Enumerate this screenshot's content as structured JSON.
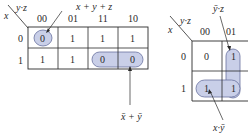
{
  "colors": {
    "grid": "#2a2a2a",
    "group_fill": "#c9cfe8",
    "group_stroke": "#6a72a0",
    "text": "#2a2a2a"
  },
  "left_map": {
    "row_var": "x",
    "col_var": "y·z",
    "col_headers": [
      "00",
      "01",
      "11",
      "10"
    ],
    "row_headers": [
      "0",
      "1"
    ],
    "cells": [
      [
        "0",
        "1",
        "1",
        "1"
      ],
      [
        "1",
        "1",
        "0",
        "0"
      ]
    ],
    "groups": [
      {
        "cells": [
          [
            0,
            0
          ]
        ],
        "label": "x + y + z"
      },
      {
        "cells": [
          [
            1,
            2
          ],
          [
            1,
            3
          ]
        ],
        "label": "x̄ + ȳ"
      }
    ],
    "labels": {
      "top_group": "x + y + z",
      "bottom_group": "x̄ + ȳ"
    }
  },
  "right_map": {
    "row_var": "x",
    "col_var": "y·z",
    "col_headers": [
      "00",
      "01"
    ],
    "row_headers": [
      "0",
      "1"
    ],
    "cells": [
      [
        "0",
        "1"
      ],
      [
        "1",
        "1"
      ]
    ],
    "groups": [
      {
        "cells": [
          [
            0,
            1
          ],
          [
            1,
            1
          ]
        ],
        "label": "ȳ·z"
      },
      {
        "cells": [
          [
            1,
            0
          ],
          [
            1,
            1
          ]
        ],
        "label": "x·ȳ"
      }
    ],
    "labels": {
      "top_group": "ȳ·z",
      "bottom_group": "x·ȳ"
    }
  }
}
